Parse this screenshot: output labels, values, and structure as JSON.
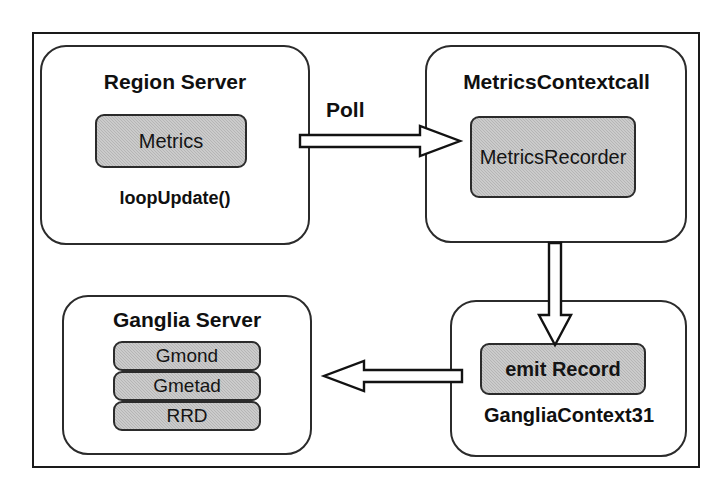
{
  "nodes": {
    "region_server": {
      "title": "Region Server",
      "inner": "Metrics",
      "sub": "loopUpdate()"
    },
    "metrics_context": {
      "title": "MetricsContextcall",
      "inner": "Metrics\nRecorder",
      "inner_line1": "Metrics",
      "inner_line2": "Recorder"
    },
    "ganglia_server": {
      "title": "Ganglia Server",
      "stack": [
        {
          "label": "Gmond"
        },
        {
          "label": "Gmetad"
        },
        {
          "label": "RRD"
        }
      ]
    },
    "ganglia_context": {
      "inner": "emit Record",
      "sub": "GangliaContext31"
    }
  },
  "edges": [
    {
      "id": "poll",
      "label": "Poll",
      "from": "region_server",
      "to": "metrics_context",
      "direction": "right",
      "style": "hollow-block-arrow"
    },
    {
      "id": "record",
      "label": "",
      "from": "metrics_context",
      "to": "ganglia_context",
      "direction": "down",
      "style": "hollow-block-arrow"
    },
    {
      "id": "publish",
      "label": "",
      "from": "ganglia_context",
      "to": "ganglia_server",
      "direction": "left",
      "style": "hollow-block-arrow"
    }
  ],
  "colors": {
    "background": "#ffffff",
    "stroke": "#2b2b2b",
    "frame": "#1a1a1a",
    "shaded_fill": "#b5b5b5",
    "text": "#101010"
  }
}
